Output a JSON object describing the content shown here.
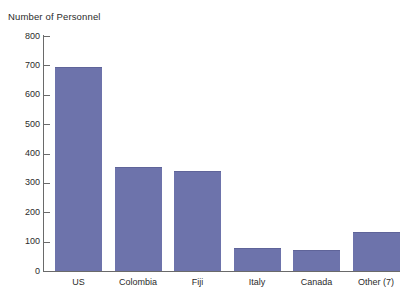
{
  "chart_data": {
    "type": "bar",
    "title": "Number of Personnel",
    "xlabel": "",
    "ylabel": "",
    "categories": [
      "US",
      "Colombia",
      "Fiji",
      "Italy",
      "Canada",
      "Other (7)"
    ],
    "values": [
      695,
      355,
      340,
      80,
      72,
      133
    ],
    "ylim": [
      0,
      800
    ],
    "ytick_labels": [
      "800",
      "700",
      "600",
      "500",
      "400",
      "300",
      "200",
      "100",
      "0"
    ],
    "ytick_values": [
      800,
      700,
      600,
      500,
      400,
      300,
      200,
      100,
      0
    ],
    "grid": false,
    "legend": false,
    "bar_color": "#6d73ab",
    "axis_color": "#6a6a6a",
    "background_color": "#ffffff",
    "text_color": "#2b2b2b"
  }
}
